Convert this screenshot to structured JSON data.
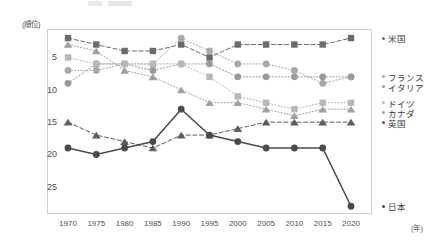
{
  "axis": {
    "y_unit_label": "(順位)",
    "x_unit_label": "(年)",
    "y_ticks": [
      "5",
      "10",
      "15",
      "20",
      "25"
    ],
    "x_ticks": [
      "1970",
      "1975",
      "1980",
      "1985",
      "1990",
      "1995",
      "2000",
      "2005",
      "2010",
      "2015",
      "2020"
    ]
  },
  "legend": {
    "items": [
      {
        "label": "米国",
        "color": "#6b6b6b"
      },
      {
        "label": "フランス",
        "color": "#a8a8a8"
      },
      {
        "label": "イタリア",
        "color": "#9a9a9a"
      },
      {
        "label": "ドイツ",
        "color": "#b8b8b8"
      },
      {
        "label": "カナダ",
        "color": "#a0a0a0"
      },
      {
        "label": "英国",
        "color": "#5e5e5e"
      },
      {
        "label": "日本",
        "color": "#4a4a4a"
      }
    ]
  },
  "chart_data": {
    "type": "line",
    "title": "",
    "subtitle": "",
    "xlabel": "(年)",
    "ylabel": "(順位)",
    "x": [
      1970,
      1975,
      1980,
      1985,
      1990,
      1995,
      2000,
      2005,
      2010,
      2015,
      2020
    ],
    "ylim": [
      1,
      28
    ],
    "y_inverted": true,
    "y_ticks": [
      5,
      10,
      15,
      20,
      25
    ],
    "grid": false,
    "legend_position": "right",
    "series": [
      {
        "name": "米国",
        "color": "#6b6b6b",
        "marker": "square",
        "line_style": "dashed",
        "values": [
          2,
          3,
          4,
          4,
          3,
          5,
          3,
          3,
          3,
          3,
          2
        ]
      },
      {
        "name": "フランス",
        "color": "#a8a8a8",
        "marker": "circle",
        "line_style": "dotted",
        "values": [
          7,
          7,
          6,
          6,
          2,
          4,
          6,
          6,
          7,
          9,
          8
        ]
      },
      {
        "name": "イタリア",
        "color": "#9a9a9a",
        "marker": "circle",
        "line_style": "dotted",
        "values": [
          9,
          6,
          6,
          7,
          6,
          6,
          8,
          8,
          8,
          8,
          8
        ]
      },
      {
        "name": "ドイツ",
        "color": "#b8b8b8",
        "marker": "square",
        "line_style": "dotted",
        "values": [
          5,
          6,
          6,
          6,
          6,
          8,
          11,
          12,
          13,
          12,
          12
        ]
      },
      {
        "name": "カナダ",
        "color": "#a0a0a0",
        "marker": "triangle",
        "line_style": "dotted",
        "values": [
          3,
          4,
          7,
          8,
          10,
          12,
          12,
          13,
          14,
          13,
          13
        ]
      },
      {
        "name": "英国",
        "color": "#5e5e5e",
        "marker": "triangle",
        "line_style": "dashed",
        "values": [
          15,
          17,
          18,
          19,
          17,
          17,
          16,
          15,
          15,
          15,
          15
        ]
      },
      {
        "name": "日本",
        "color": "#4a4a4a",
        "marker": "circle",
        "line_style": "solid",
        "values": [
          19,
          20,
          19,
          18,
          13,
          17,
          18,
          19,
          19,
          19,
          28
        ]
      }
    ]
  }
}
